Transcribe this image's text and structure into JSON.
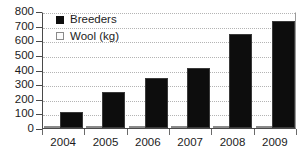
{
  "chart_data": {
    "type": "bar",
    "title": "",
    "subtitle": "",
    "xlabel": "",
    "ylabel": "",
    "categories": [
      "2004",
      "2005",
      "2006",
      "2007",
      "2008",
      "2009"
    ],
    "series": [
      {
        "name": "Breeders",
        "color": "#0d0d0d",
        "values": [
          110,
          245,
          345,
          410,
          645,
          730
        ]
      },
      {
        "name": "Wool (kg)",
        "color": "#d4d4d4",
        "values": [
          4,
          5,
          4,
          6,
          8,
          15
        ]
      }
    ],
    "ylim": [
      0,
      800
    ],
    "yticks": [
      0,
      100,
      200,
      300,
      400,
      500,
      600,
      700,
      800
    ],
    "ytick_labels": [
      "0",
      "100",
      "200",
      "300",
      "400",
      "500",
      "600",
      "700",
      "800"
    ],
    "grid": true,
    "grid_axis": "y",
    "grid_style": "dotted",
    "legend_position": "top-left",
    "legend": [
      {
        "label": "Breeders",
        "swatch": "filled-square"
      },
      {
        "label": "Wool (kg)",
        "swatch": "open-square"
      }
    ]
  }
}
